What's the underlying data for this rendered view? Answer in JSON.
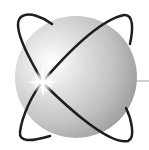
{
  "logo": {
    "icon": "atom-sphere-icon",
    "colors": {
      "background": "#ffffff",
      "sphere_light": "#f4f4f4",
      "sphere_mid": "#c4c4c4",
      "sphere_dark": "#8e8e8e",
      "orbit": "#1e1e1e",
      "pointer_line": "#a0a0a0"
    }
  }
}
